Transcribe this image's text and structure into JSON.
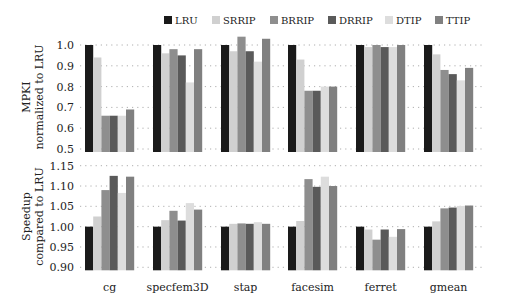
{
  "legend": {
    "items": [
      {
        "label": "LRU",
        "color": "#1a1a1a"
      },
      {
        "label": "SRRIP",
        "color": "#d0d0d0"
      },
      {
        "label": "BRRIP",
        "color": "#8e8e8e"
      },
      {
        "label": "DRRIP",
        "color": "#5a5a5a"
      },
      {
        "label": "DTIP",
        "color": "#dddddd"
      },
      {
        "label": "TTIP",
        "color": "#808080"
      }
    ]
  },
  "chart_data": [
    {
      "type": "bar",
      "title": "",
      "ylabel": "MPKI normalized to LRU",
      "ylabel_lines": [
        "MPKI",
        "normalized to LRU"
      ],
      "xlabel": "",
      "categories": [
        "cg",
        "specfem3D",
        "stap",
        "facesim",
        "ferret",
        "gmean"
      ],
      "ylim": [
        0.5,
        1.0
      ],
      "yticks": [
        "1.0",
        "0.9",
        "0.8",
        "0.7",
        "0.6",
        "0.5"
      ],
      "ytick_values": [
        1.0,
        0.9,
        0.8,
        0.7,
        0.6,
        0.5
      ],
      "grid": true,
      "legend_position": "top",
      "series": [
        {
          "name": "LRU",
          "values": [
            1.0,
            1.0,
            1.0,
            1.0,
            1.0,
            1.0
          ]
        },
        {
          "name": "SRRIP",
          "values": [
            0.94,
            0.96,
            0.97,
            0.93,
            0.99,
            0.955
          ]
        },
        {
          "name": "BRRIP",
          "values": [
            0.66,
            0.98,
            1.04,
            0.78,
            1.0,
            0.88
          ]
        },
        {
          "name": "DRRIP",
          "values": [
            0.66,
            0.95,
            0.97,
            0.78,
            0.99,
            0.86
          ]
        },
        {
          "name": "DTIP",
          "values": [
            0.66,
            0.82,
            0.92,
            0.8,
            0.99,
            0.83
          ]
        },
        {
          "name": "TTIP",
          "values": [
            0.69,
            0.98,
            1.03,
            0.8,
            1.0,
            0.89
          ]
        }
      ]
    },
    {
      "type": "bar",
      "title": "",
      "ylabel": "Speedup compared to LRU",
      "ylabel_lines": [
        "Speedup",
        "compared to LRU"
      ],
      "xlabel": "",
      "categories": [
        "cg",
        "specfem3D",
        "stap",
        "facesim",
        "ferret",
        "gmean"
      ],
      "ylim": [
        0.9,
        1.15
      ],
      "yticks": [
        "1.15",
        "1.10",
        "1.05",
        "1.00",
        "0.95",
        "0.90"
      ],
      "ytick_values": [
        1.15,
        1.1,
        1.05,
        1.0,
        0.95,
        0.9
      ],
      "grid": true,
      "series": [
        {
          "name": "LRU",
          "values": [
            1.0,
            1.0,
            1.0,
            1.0,
            1.0,
            1.0
          ]
        },
        {
          "name": "SRRIP",
          "values": [
            1.025,
            1.016,
            1.007,
            1.014,
            0.993,
            1.013
          ]
        },
        {
          "name": "BRRIP",
          "values": [
            1.09,
            1.039,
            1.008,
            1.117,
            0.968,
            1.045
          ]
        },
        {
          "name": "DRRIP",
          "values": [
            1.125,
            1.015,
            1.007,
            1.098,
            0.993,
            1.047
          ]
        },
        {
          "name": "DTIP",
          "values": [
            1.083,
            1.058,
            1.011,
            1.123,
            0.975,
            1.051
          ]
        },
        {
          "name": "TTIP",
          "values": [
            1.123,
            1.042,
            1.007,
            1.1,
            0.994,
            1.052
          ]
        }
      ]
    }
  ]
}
